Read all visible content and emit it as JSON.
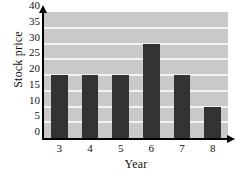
{
  "chart_data": {
    "type": "bar",
    "title": "",
    "subtitle": "",
    "xlabel": "Year",
    "ylabel": "Stock price",
    "categories": [
      "3",
      "4",
      "5",
      "6",
      "7",
      "8"
    ],
    "values": [
      20,
      20,
      20,
      30,
      20,
      10
    ],
    "series": [
      {
        "name": "Stock price",
        "values": [
          20,
          20,
          20,
          30,
          20,
          10
        ]
      }
    ],
    "ylim": [
      0,
      40
    ],
    "y_ticks": [
      0,
      5,
      10,
      15,
      20,
      25,
      30,
      35,
      40
    ],
    "y_tick_labels": [
      "0",
      "5",
      "10",
      "15",
      "20",
      "25",
      "30",
      "35",
      "40"
    ],
    "x_ticks": [
      "3",
      "4",
      "5",
      "6",
      "7",
      "8"
    ],
    "grid": true,
    "grid_orientation": "horizontal",
    "legend": null,
    "legend_position": "none",
    "annotations": [],
    "colors": {
      "bar": "#333333",
      "plot_background": "#c9c9c9",
      "gridline": "#f2f2f2",
      "axis": "#000000",
      "text": "#111111",
      "figure_background": "#ffffff"
    },
    "axis_arrows": {
      "y_axis_arrow": "arrow-up-icon",
      "x_axis_arrow": "arrow-right-icon"
    }
  }
}
